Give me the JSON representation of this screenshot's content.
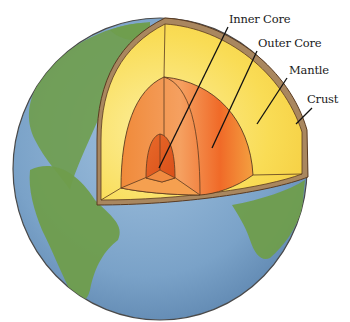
{
  "diagram": {
    "labels": [
      {
        "id": "inner-core",
        "text": "Inner Core"
      },
      {
        "id": "outer-core",
        "text": "Outer Core"
      },
      {
        "id": "mantle",
        "text": "Mantle"
      },
      {
        "id": "crust",
        "text": "Crust"
      }
    ]
  },
  "colors": {
    "ocean": "#7ea6cc",
    "land": "#6f9d4c",
    "crust": "#a9875f",
    "mantle": "#f8d84e",
    "mantle_light": "#fcec9a",
    "outer_core": "#f07030",
    "inner_core": "#e25a1e",
    "outline": "#5a3a20"
  }
}
